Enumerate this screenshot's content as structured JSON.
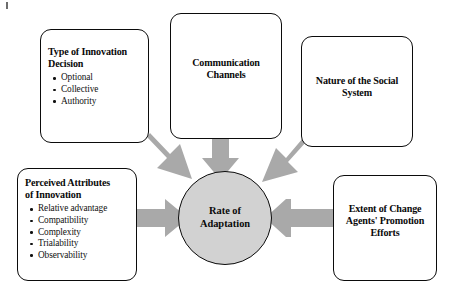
{
  "canvas": {
    "width": 450,
    "height": 291,
    "background": "#ffffff"
  },
  "palette": {
    "arrow_gray": "#a9a9a9",
    "circle_gray": "#d2d2d2",
    "stroke_black": "#0b0b0b",
    "box_white": "#ffffff",
    "text_black": "#0a0a0a"
  },
  "diagram": {
    "type": "influence-diagram",
    "center": {
      "id": "rate-of-adaptation",
      "label_line1": "Rate of",
      "label_line2": "Adaptation",
      "shape": "circle",
      "fill": "#d2d2d2"
    },
    "boxes": [
      {
        "id": "type-of-innovation-decision",
        "title_line1": "Type of Innovation",
        "title_line2": "Decision",
        "align": "left",
        "bullets": [
          "Optional",
          "Collective",
          "Authority"
        ]
      },
      {
        "id": "communication-channels",
        "title_line1": "Communication",
        "title_line2": "Channels",
        "align": "center",
        "bullets": []
      },
      {
        "id": "nature-of-the-social-system",
        "title_line1": "Nature of the Social",
        "title_line2": "System",
        "align": "center",
        "bullets": []
      },
      {
        "id": "perceived-attributes-of-innovation",
        "title_line1": "Perceived Attributes",
        "title_line2": "of Innovation",
        "align": "left",
        "bullets": [
          "Relative advantage",
          "Compatibility",
          "Complexity",
          "Trialability",
          "Observability"
        ]
      },
      {
        "id": "extent-of-change-agents-promotion-efforts",
        "title_line1": "Extent of Change",
        "title_line2": "Agents' Promotion",
        "title_line3": "Efforts",
        "align": "center",
        "bullets": []
      }
    ],
    "arrows": [
      {
        "id": "arrow-from-type-of-innovation-decision",
        "from": "type-of-innovation-decision",
        "to": "rate-of-adaptation",
        "direction": "diagonal-down-right"
      },
      {
        "id": "arrow-from-communication-channels",
        "from": "communication-channels",
        "to": "rate-of-adaptation",
        "direction": "down"
      },
      {
        "id": "arrow-from-nature-of-the-social-system",
        "from": "nature-of-the-social-system",
        "to": "rate-of-adaptation",
        "direction": "diagonal-down-left"
      },
      {
        "id": "arrow-from-perceived-attributes",
        "from": "perceived-attributes-of-innovation",
        "to": "rate-of-adaptation",
        "direction": "right"
      },
      {
        "id": "arrow-from-extent-of-change-agents",
        "from": "extent-of-change-agents-promotion-efforts",
        "to": "rate-of-adaptation",
        "direction": "left"
      }
    ]
  }
}
